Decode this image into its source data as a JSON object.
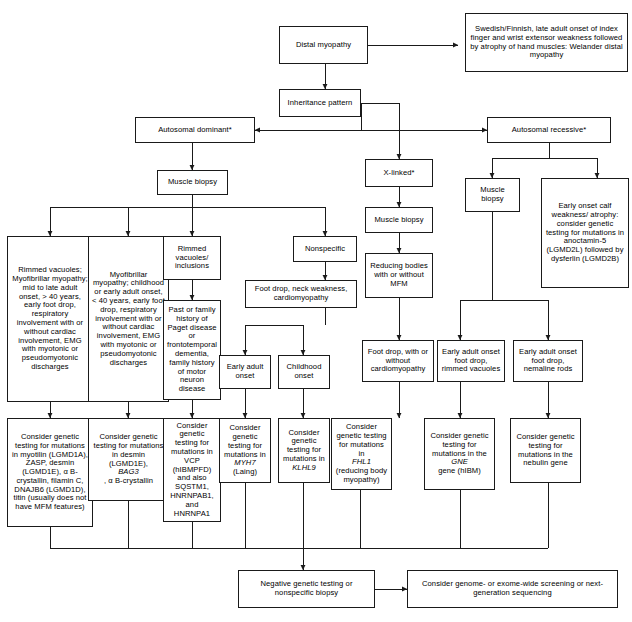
{
  "diagram": {
    "type": "flowchart",
    "background": "#ffffff",
    "line_color": "#1a1a1a",
    "nodes": {
      "distal_myopathy": "Distal myopathy",
      "welander": "Swedish/Finnish, late adult onset of index finger and wrist extensor weakness followed by atrophy of hand muscles: Welander distal myopathy",
      "inheritance_pattern": "Inheritance pattern",
      "autosomal_dominant": "Autosomal dominant*",
      "autosomal_recessive": "Autosomal recessive*",
      "x_linked": "X-linked*",
      "muscle_biopsy_ad": "Muscle biopsy",
      "muscle_biopsy_x": "Muscle biopsy",
      "muscle_biopsy_ar": "Muscle biopsy",
      "rimmed_vacuoles_mfm": "Rimmed vacuoles; Myofibrillar myopathy; mid to late adult onset, > 40 years, early foot drop, respiratory involvement with or without cardiac involvement, EMG with myotonic or pseudomyotonic discharges",
      "myofibrillar_childhood": "Myofibrillar myopathy; childhood or early adult onset, < 40 years, early foot drop, respiratory involvement with or without cardiac involvement, EMG with myotonic or pseudomyotonic discharges",
      "rimmed_vacuoles_inclusions": "Rimmed vacuoles/ inclusions",
      "paget_history": "Past or family history of Paget disease or frontotemporal dementia, family history of motor neuron disease",
      "nonspecific": "Nonspecific",
      "foot_drop_neck": "Foot drop, neck weakness, cardiomyopathy",
      "early_adult_onset": "Early adult onset",
      "childhood_onset": "Childhood onset",
      "reducing_bodies": "Reducing bodies with or without MFM",
      "foot_drop_cardio": "Foot drop, with or without cardiomyopathy",
      "early_onset_calf": "Early onset calf weakness/ atrophy: consider genetic testing for mutations in anoctamin-5 (LGMD2L) followed by dysferlin (LGMD2B)",
      "early_adult_rimmed": "Early adult onset foot drop, rimmed vacuoles",
      "early_adult_nemaline": "Early adult onset foot drop, nemaline rods",
      "genetic_myotilin": "Consider genetic testing for mutations in myotilin (LGMD1A), ZASP, desmin (LGMD1E), α B-crystallin, filamin C, DNAJB6 (LGMD1D), titin (usually does not have MFM features)",
      "genetic_desmin": "Consider genetic testing for mutations in desmin (LGMD1E), BAG3, α B-crystallin",
      "genetic_vcp": "Consider genetic testing for mutations in VCP (hIBMPFD) and also SQSTM1, HNRNPAB1, and HNRNPA1",
      "genetic_myh7": "Consider genetic testing for mutations in MYH7 (Laing)",
      "genetic_klhl9": "Consider genetic testing for mutations in KLHL9",
      "genetic_fhl1": "Consider genetic testing for mutations in FHL1 (reducing body myopathy)",
      "genetic_gne": "Consider genetic testing for mutations in the GNE gene (hIBM)",
      "genetic_nebulin": "Consider genetic testing for mutations in the nebulin gene",
      "negative_testing": "Negative genetic testing or nonspecific biopsy",
      "genome_wide": "Consider genome- or exome-wide screening or next-generation sequencing"
    },
    "node_parts": {
      "genetic_desmin": {
        "a": "Consider genetic testing for mutations in desmin (LGMD1E),",
        "b": "BAG3",
        "c": ", α B-crystallin"
      },
      "genetic_myh7": {
        "a": "Consider genetic testing for mutations in ",
        "b": "MYH7",
        "c": "(Laing)"
      },
      "genetic_klhl9": {
        "a": "Consider genetic testing for mutations in ",
        "b": "KLHL9"
      },
      "genetic_fhl1": {
        "a": "Consider genetic testing for mutations in ",
        "b": "FHL1",
        "c": " (reducing body myopathy)"
      },
      "genetic_gne": {
        "a": "Consider genetic testing for mutations in the ",
        "b": "GNE",
        "c": " gene (hIBM)"
      }
    }
  }
}
